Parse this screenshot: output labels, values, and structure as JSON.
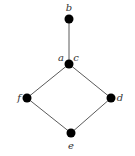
{
  "diagram": {
    "type": "lattice",
    "nodes": [
      {
        "id": "b",
        "label": "b"
      },
      {
        "id": "ac",
        "labels": [
          "a",
          "c"
        ]
      },
      {
        "id": "f",
        "label": "f"
      },
      {
        "id": "d",
        "label": "d"
      },
      {
        "id": "e",
        "label": "e"
      }
    ],
    "edges": [
      {
        "from": "b",
        "to": "ac"
      },
      {
        "from": "ac",
        "to": "f"
      },
      {
        "from": "ac",
        "to": "d"
      },
      {
        "from": "f",
        "to": "e"
      },
      {
        "from": "d",
        "to": "e"
      }
    ],
    "colors": {
      "node": "#000000",
      "edge": "#5a5a5a"
    }
  }
}
